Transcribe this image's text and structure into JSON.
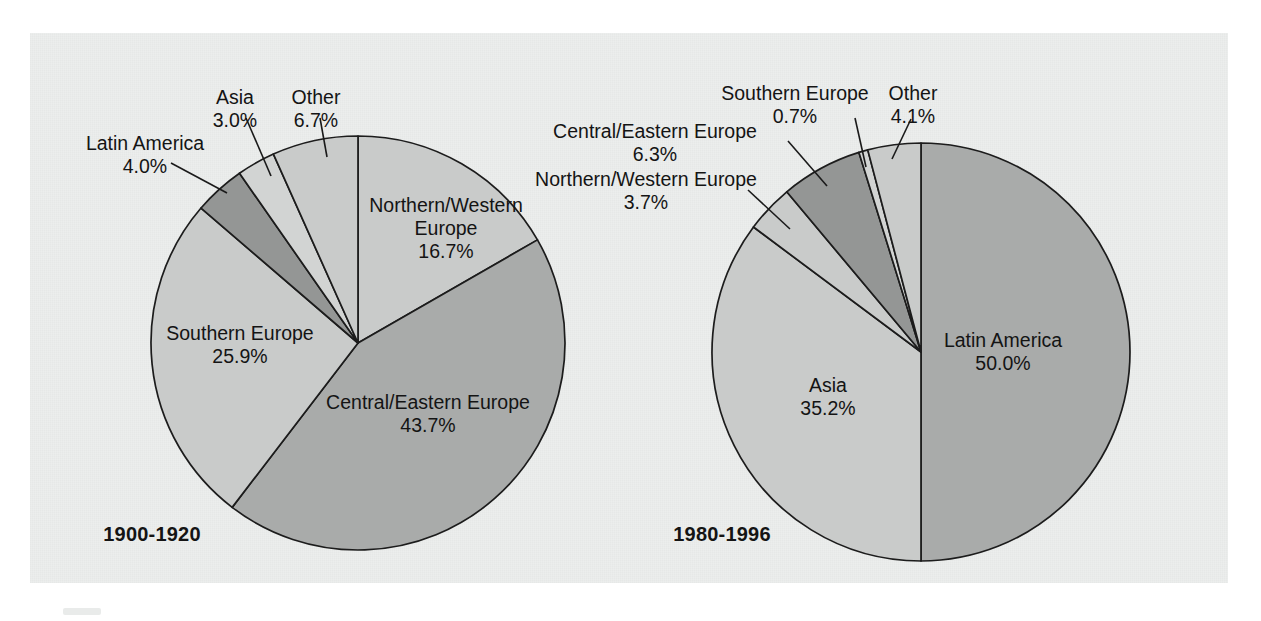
{
  "figure": {
    "background_color": "#eceeed",
    "page_color": "#ffffff",
    "outline_color": "#1c1c1c"
  },
  "palette": {
    "light": "#c9cbca",
    "medium": "#a9abaa",
    "dark": "#949695",
    "pale": "#d2d4d3"
  },
  "charts": [
    {
      "id": "chart-1900-1920",
      "caption": "1900-1920",
      "caption_x": 152,
      "caption_y": 541,
      "cx": 358,
      "cy": 343,
      "r": 207,
      "start_angle_deg": 0
    },
    {
      "id": "chart-1980-1996",
      "caption": "1980-1996",
      "caption_x": 722,
      "caption_y": 541,
      "cx": 921,
      "cy": 352,
      "r": 209,
      "start_angle_deg": 0
    }
  ],
  "chart_data": [
    {
      "type": "pie",
      "title": "1900-1920",
      "xlabel": "",
      "ylabel": "",
      "units": "percent",
      "legend_position": "callout-labels",
      "categories": [
        "Northern/Western Europe",
        "Central/Eastern Europe",
        "Southern Europe",
        "Latin America",
        "Asia",
        "Other"
      ],
      "values": [
        16.7,
        43.7,
        25.9,
        4.0,
        3.0,
        6.7
      ],
      "value_labels": [
        "16.7%",
        "43.7%",
        "25.9%",
        "4.0%",
        "3.0%",
        "6.7%"
      ],
      "slice_fills": [
        "light",
        "medium",
        "light",
        "dark",
        "pale",
        "light"
      ],
      "slices": [
        {
          "name": "Northern/Western Europe",
          "value": 16.7,
          "label_lines": [
            "Northern/Western",
            "Europe",
            "16.7%"
          ],
          "label_kind": "inside",
          "label_x": 446,
          "label_y": 212,
          "label_anchor": "middle",
          "leader": null
        },
        {
          "name": "Central/Eastern Europe",
          "value": 43.7,
          "label_lines": [
            "Central/Eastern Europe",
            "43.7%"
          ],
          "label_kind": "inside",
          "label_x": 428,
          "label_y": 409,
          "label_anchor": "middle",
          "leader": null
        },
        {
          "name": "Southern Europe",
          "value": 25.9,
          "label_lines": [
            "Southern Europe",
            "25.9%"
          ],
          "label_kind": "inside",
          "label_x": 240,
          "label_y": 340,
          "label_anchor": "middle",
          "leader": null
        },
        {
          "name": "Latin America",
          "value": 4.0,
          "label_lines": [
            "Latin America",
            "4.0%"
          ],
          "label_kind": "callout",
          "label_x": 145,
          "label_y": 150,
          "label_anchor": "middle",
          "leader": [
            [
              171,
              163
            ],
            [
              227,
              193
            ]
          ]
        },
        {
          "name": "Asia",
          "value": 3.0,
          "label_lines": [
            "Asia",
            "3.0%"
          ],
          "label_kind": "callout",
          "label_x": 235,
          "label_y": 104,
          "label_anchor": "middle",
          "leader": [
            [
              246,
              118
            ],
            [
              271,
              176
            ]
          ]
        },
        {
          "name": "Other",
          "value": 6.7,
          "label_lines": [
            "Other",
            "6.7%"
          ],
          "label_kind": "callout",
          "label_x": 316,
          "label_y": 104,
          "label_anchor": "middle",
          "leader": [
            [
              320,
              118
            ],
            [
              327,
              157
            ]
          ]
        }
      ]
    },
    {
      "type": "pie",
      "title": "1980-1996",
      "xlabel": "",
      "ylabel": "",
      "units": "percent",
      "legend_position": "callout-labels",
      "categories": [
        "Latin America",
        "Asia",
        "Northern/Western Europe",
        "Central/Eastern Europe",
        "Southern Europe",
        "Other"
      ],
      "values": [
        50.0,
        35.2,
        3.7,
        6.3,
        0.7,
        4.1
      ],
      "value_labels": [
        "50.0%",
        "35.2%",
        "3.7%",
        "6.3%",
        "0.7%",
        "4.1%"
      ],
      "slice_fills": [
        "medium",
        "light",
        "light",
        "dark",
        "pale",
        "light"
      ],
      "slices": [
        {
          "name": "Latin America",
          "value": 50.0,
          "label_lines": [
            "Latin America",
            "50.0%"
          ],
          "label_kind": "inside",
          "label_x": 1003,
          "label_y": 347,
          "label_anchor": "middle",
          "leader": null
        },
        {
          "name": "Asia",
          "value": 35.2,
          "label_lines": [
            "Asia",
            "35.2%"
          ],
          "label_kind": "inside",
          "label_x": 828,
          "label_y": 392,
          "label_anchor": "middle",
          "leader": null
        },
        {
          "name": "Northern/Western Europe",
          "value": 3.7,
          "label_lines": [
            "Northern/Western Europe",
            "3.7%"
          ],
          "label_kind": "callout",
          "label_x": 646,
          "label_y": 186,
          "label_anchor": "middle",
          "leader": [
            [
              748,
              190
            ],
            [
              790,
              229
            ]
          ]
        },
        {
          "name": "Central/Eastern Europe",
          "value": 6.3,
          "label_lines": [
            "Central/Eastern Europe",
            "6.3%"
          ],
          "label_kind": "callout",
          "label_x": 655,
          "label_y": 138,
          "label_anchor": "middle",
          "leader": [
            [
              788,
              141
            ],
            [
              827,
              186
            ]
          ]
        },
        {
          "name": "Southern Europe",
          "value": 0.7,
          "label_lines": [
            "Southern Europe",
            "0.7%"
          ],
          "label_kind": "callout",
          "label_x": 795,
          "label_y": 100,
          "label_anchor": "middle",
          "leader": [
            [
              855,
              118
            ],
            [
              866,
              167
            ]
          ]
        },
        {
          "name": "Other",
          "value": 4.1,
          "label_lines": [
            "Other",
            "4.1%"
          ],
          "label_kind": "callout",
          "label_x": 913,
          "label_y": 100,
          "label_anchor": "middle",
          "leader": [
            [
              911,
              119
            ],
            [
              892,
              159
            ]
          ]
        }
      ]
    }
  ]
}
